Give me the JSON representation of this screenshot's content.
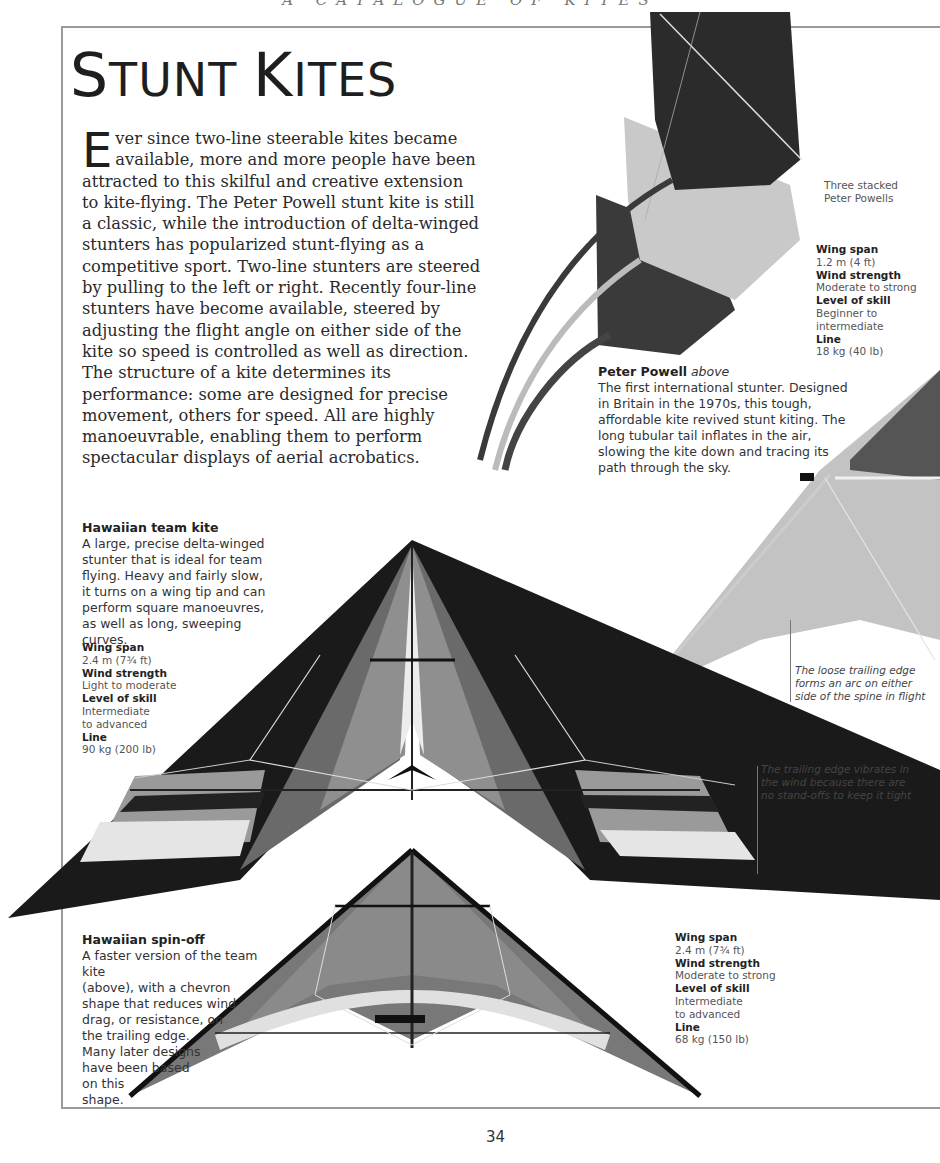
{
  "running_head": "A CATALOGUE OF KITES",
  "title": {
    "first_big": "S",
    "first_rest": "TUNT ",
    "second_big": "K",
    "second_rest": "ITES"
  },
  "intro": {
    "drop_cap": "E",
    "text": "ver since two-line steerable kites became available, more and more people have been attracted to this skilful and creative extension to kite-flying. The Peter Powell stunt kite is still a classic, while the introduction of delta-winged stunters has popularized stunt-flying as a competitive sport. Two-line stunters are steered by pulling to the left or right. Recently four-line stunters have become available, steered by adjusting the flight angle on either side of the kite so speed is controlled as well as direction. The structure of a kite determines its performance: some are designed for precise movement, others for speed. All are highly manoeuvrable, enabling them to perform spectacular displays of aerial acrobatics."
  },
  "peter_powell": {
    "image_label_line1": "Three stacked",
    "image_label_line2": "Peter Powells",
    "name": "Peter Powell",
    "name_suffix": "above",
    "description": "The first international stunter. Designed in Britain in the 1970s, this tough, affordable kite revived stunt kiting. The long tubular tail inflates in the air, slowing the kite down and tracing its path through the sky.",
    "specs": [
      {
        "label": "Wing span",
        "value": [
          "1.2 m (4 ft)"
        ]
      },
      {
        "label": "Wind strength",
        "value": [
          "Moderate to strong"
        ]
      },
      {
        "label": "Level of skill",
        "value": [
          "Beginner to",
          "intermediate"
        ]
      },
      {
        "label": "Line",
        "value": [
          "18 kg (40 lb)"
        ]
      }
    ]
  },
  "hawaiian_team": {
    "name": "Hawaiian team kite",
    "description": "A large, precise delta-winged stunter that is ideal for team flying. Heavy and fairly slow, it turns on a wing tip and can perform square manoeuvres, as well as long, sweeping curves.",
    "specs": [
      {
        "label": "Wing span",
        "value": [
          "2.4 m (7¾ ft)"
        ]
      },
      {
        "label": "Wind strength",
        "value": [
          "Light to moderate"
        ]
      },
      {
        "label": "Level of skill",
        "value": [
          "Intermediate",
          "to advanced"
        ]
      },
      {
        "label": "Line",
        "value": [
          "90 kg (200 lb)"
        ]
      }
    ]
  },
  "hawaiian_spinoff": {
    "name": "Hawaiian spin-off",
    "description_lines": [
      "A faster version of the team kite",
      "(above), with a chevron",
      "shape that reduces wind",
      "drag, or resistance, on",
      "the trailing edge.",
      "Many later designs",
      "have been based",
      "on this",
      "shape."
    ],
    "specs": [
      {
        "label": "Wing span",
        "value": [
          "2.4 m (7¾ ft)"
        ]
      },
      {
        "label": "Wind strength",
        "value": [
          "Moderate to strong"
        ]
      },
      {
        "label": "Level of skill",
        "value": [
          "Intermediate",
          "to advanced"
        ]
      },
      {
        "label": "Line",
        "value": [
          "68 kg (150 lb)"
        ]
      }
    ]
  },
  "callouts": {
    "loose_edge": [
      "The loose trailing edge",
      "forms an arc on either",
      "side of the spine in flight"
    ],
    "vibrates": [
      "The trailing edge vibrates in",
      "the wind because there are",
      "no stand-offs to keep it tight"
    ]
  },
  "page_number": "34"
}
